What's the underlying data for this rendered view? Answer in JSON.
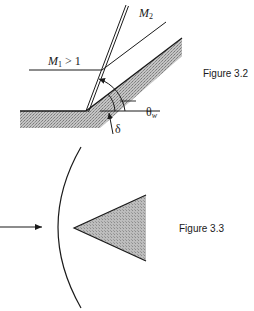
{
  "figure_3_2": {
    "caption": "Figure 3.2",
    "labels": {
      "upstream_mach_symbol": "M",
      "upstream_mach_subscript": "1",
      "upstream_mach_condition": " > 1",
      "downstream_mach_symbol": "M",
      "downstream_mach_subscript": "2",
      "shock_angle_symbol": "θ",
      "shock_angle_subscript": "w",
      "deflection_angle_symbol": "δ"
    },
    "elements": {
      "wall": "wedge-surface-with-hatching",
      "shock": "oblique-shock-double-line",
      "streamline": "deflected-streamline",
      "angle_arcs": [
        "theta-w-arc",
        "delta-arc"
      ]
    }
  },
  "figure_3_3": {
    "caption": "Figure 3.3",
    "elements": {
      "flow_arrow": "incoming-flow-arrow",
      "bow_shock": "detached-bow-shock-arc",
      "body": "wedge-body-triangle"
    }
  },
  "colors": {
    "ink": "#1a1a1a",
    "hatch_fill": "#b8b8b8",
    "body_fill": "#b5b5b5",
    "background": "#ffffff"
  }
}
